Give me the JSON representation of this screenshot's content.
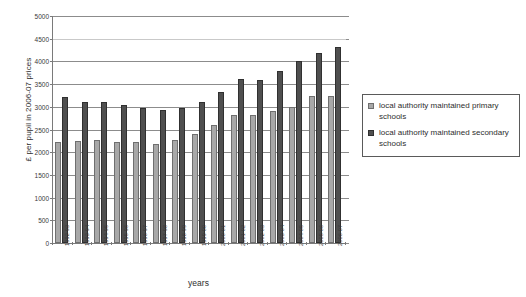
{
  "chart_data": {
    "type": "bar",
    "title": "",
    "xlabel": "years",
    "ylabel": "£ per pupil in 2006-07 prices",
    "ylim": [
      0,
      5000
    ],
    "ytick_step": 500,
    "yticks": [
      "0",
      "500",
      "1000",
      "1500",
      "2000",
      "2500",
      "3000",
      "3500",
      "4000",
      "4500",
      "5000"
    ],
    "grid": "horizontal",
    "legend_position": "right",
    "categories": [
      "1992-93",
      "1993-94",
      "1994-95",
      "1995-96",
      "1996-97",
      "1997-98",
      "1998-99",
      "1999-00",
      "2000-01",
      "2001-02",
      "2002-03",
      "2003-04",
      "2004-05",
      "2005-06",
      "2006-07"
    ],
    "series": [
      {
        "name": "local authority maintained primary schools",
        "color": "#a8a8a8",
        "values": [
          2230,
          2240,
          2280,
          2230,
          2220,
          2180,
          2270,
          2400,
          2600,
          2830,
          2820,
          2900,
          3000,
          3230,
          3240
        ]
      },
      {
        "name": "local authority maintained secondary schools",
        "color": "#4f4f4f",
        "values": [
          3210,
          3100,
          3100,
          3030,
          2980,
          2940,
          2970,
          3110,
          3320,
          3620,
          3580,
          3790,
          4000,
          4190,
          4310
        ]
      }
    ]
  },
  "legend": {
    "entries": [
      {
        "label": "local authority maintained primary schools",
        "swatch": "primary"
      },
      {
        "label": "local authority maintained secondary schools",
        "swatch": "secondary"
      }
    ]
  }
}
